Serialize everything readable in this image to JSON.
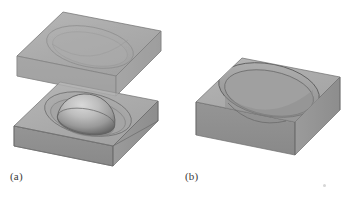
{
  "figure": {
    "type": "technical-illustration",
    "background_color": "#ffffff",
    "width": 347,
    "height": 199,
    "panels": [
      {
        "id": "a",
        "label": "(a)",
        "label_x": 10,
        "label_y": 170,
        "description": "Exploded isometric view of a two-part rectangular mold block: an upper slab lifted above a lower slab, with a hemispherical dome resting inside the lower cavity",
        "parts": [
          {
            "name": "upper-block",
            "kind": "rectangular-slab",
            "state": "lifted",
            "cavity": "hemispherical-recess-in-underside"
          },
          {
            "name": "lower-block",
            "kind": "rectangular-slab",
            "state": "base",
            "cavity": "circular-recess"
          },
          {
            "name": "sphere",
            "kind": "hemisphere-dome",
            "state": "seated-in-lower-cavity"
          }
        ]
      },
      {
        "id": "b",
        "label": "(b)",
        "label_x": 185,
        "label_y": 170,
        "description": "Assembled isometric view of a single rectangular block containing a large elliptical cavity",
        "parts": [
          {
            "name": "block",
            "kind": "rectangular-slab",
            "state": "assembled",
            "cavity": "large-elliptical-recess"
          }
        ]
      }
    ]
  },
  "palette": {
    "top_face": "#a9a9a9",
    "top_face_light": "#b4b4b4",
    "front_face": "#8f8f8f",
    "front_face_dark": "#858585",
    "side_face": "#9c9c9c",
    "cavity_floor": "#9a9a9a",
    "cavity_wall": "#8a8a8a",
    "sphere_light": "#cfcfcf",
    "sphere_mid": "#a0a0a0",
    "sphere_dark": "#6e6e6e",
    "edge_line": "#6f6f6f",
    "edge_line_soft": "#7d7d7d",
    "label_color": "#3a3a3a",
    "background": "#ffffff",
    "speck": "#d6d6d6"
  },
  "artifacts": {
    "speck": {
      "name": "scan-speck",
      "x": 323,
      "y": 184,
      "size": 3
    }
  }
}
